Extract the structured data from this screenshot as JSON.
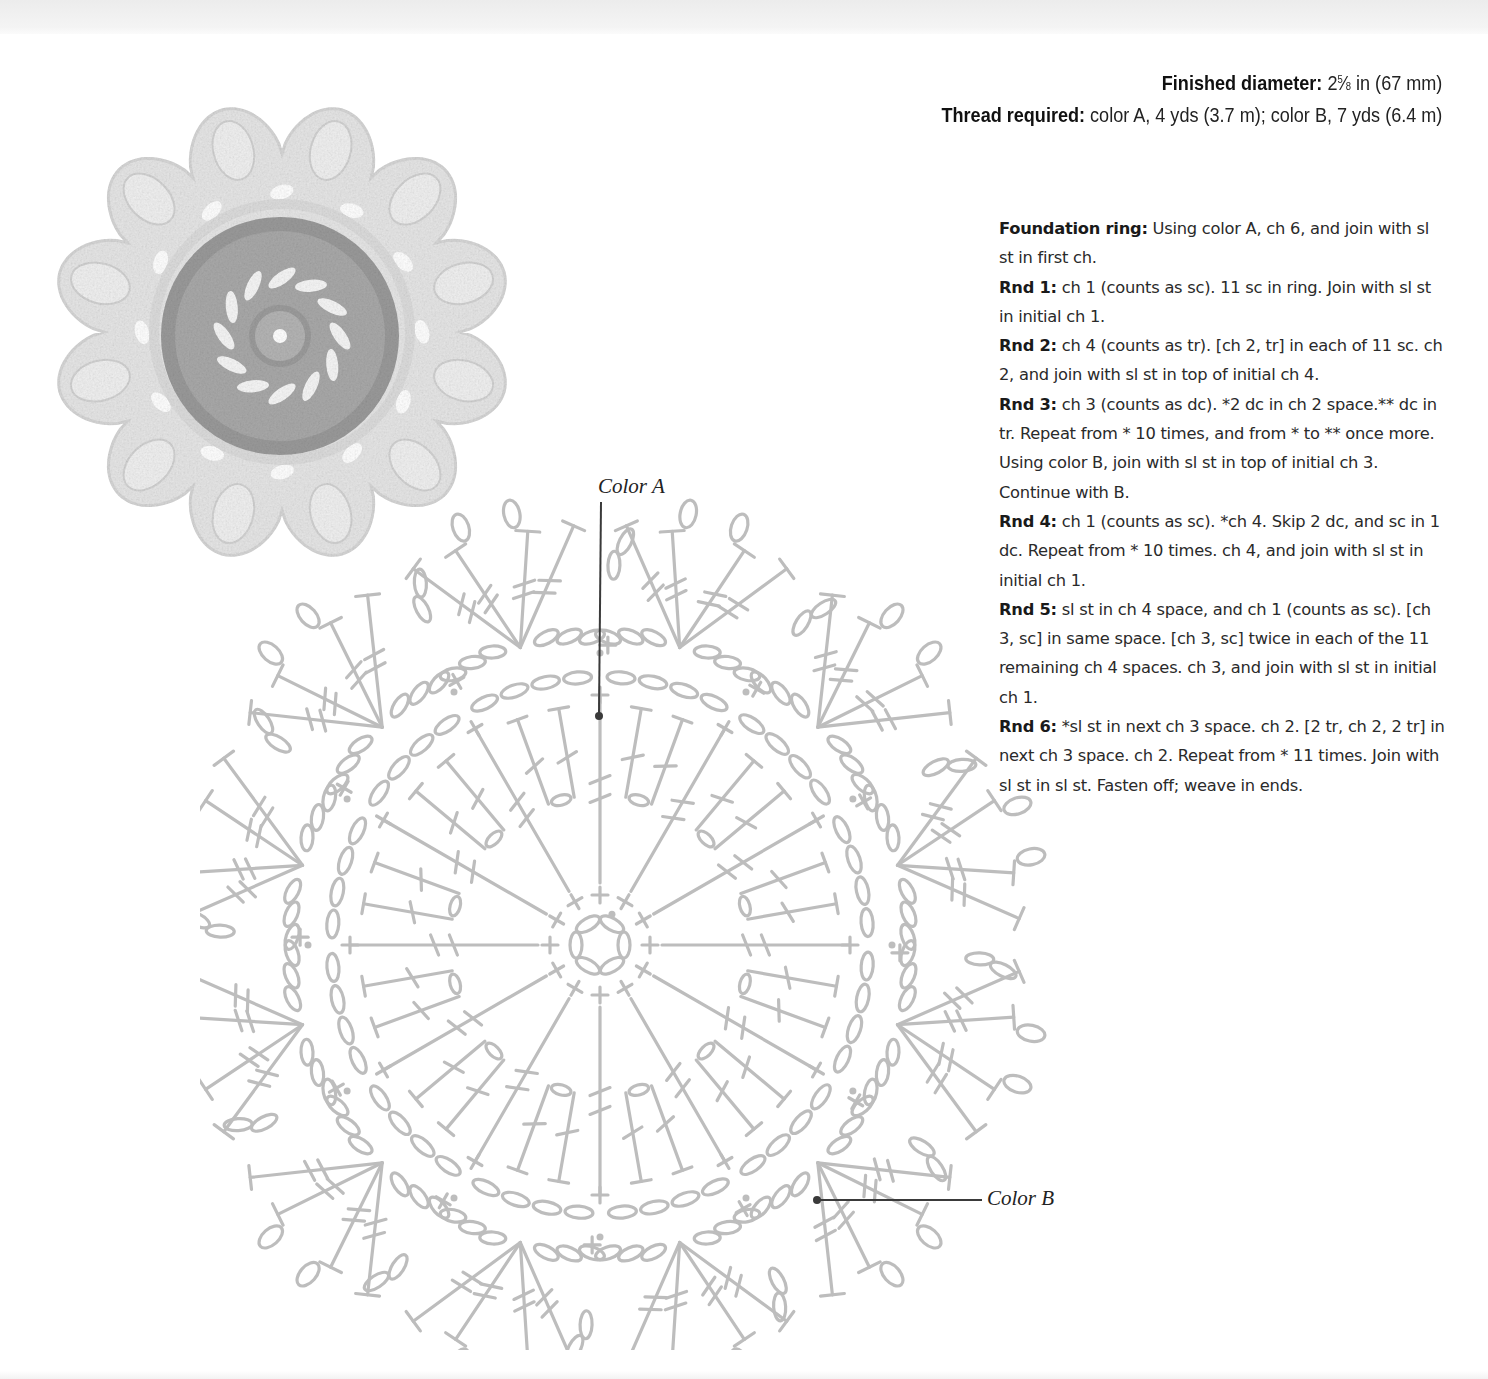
{
  "specs": {
    "diameter_label": "Finished diameter:",
    "diameter_whole": "2",
    "diameter_num": "5",
    "diameter_slash": "⁄",
    "diameter_den": "8",
    "diameter_rest": " in (67 mm)",
    "thread_label": "Thread required:",
    "thread_value": " color A, 4 yds (3.7 m); color B, 7 yds (6.4 m)"
  },
  "instructions": [
    {
      "label": "Foundation ring:",
      "text": " Using color A, ch 6, and join with sl st in first ch."
    },
    {
      "label": "Rnd 1:",
      "text": " ch 1 (counts as sc). 11 sc in ring. Join with sl st in initial ch 1."
    },
    {
      "label": "Rnd 2:",
      "text": " ch 4 (counts as tr). [ch 2, tr] in each of 11 sc. ch 2, and join with sl st in top of initial ch 4."
    },
    {
      "label": "Rnd 3:",
      "text": " ch 3 (counts as dc). *2 dc in ch 2 space.** dc in tr. Repeat from * 10 times, and from * to ** once more. Using color B, join with sl st in top of initial ch 3. Continue with B."
    },
    {
      "label": "Rnd 4:",
      "text": " ch 1 (counts as sc). *ch 4. Skip 2 dc, and sc in 1 dc. Repeat from * 10 times. ch 4, and join with sl st in initial ch 1."
    },
    {
      "label": "Rnd 5:",
      "text": " sl st in ch 4 space, and ch 1 (counts as sc). [ch 3, sc] in same space. [ch 3, sc] twice in each of the 11 remaining ch 4 spaces. ch 3, and join with sl st in initial ch 1."
    },
    {
      "label": "Rnd 6:",
      "text": " *sl st in next ch 3 space. ch 2. [2 tr, ch 2, 2 tr] in next ch 3 space. ch 2. Repeat from * 11 times. Join with sl st in sl st. Fasten off; weave in ends."
    }
  ],
  "chart": {
    "callout_a": "Color A",
    "callout_b": "Color B",
    "repeats": 12,
    "stitch_color": "#bdbdbd",
    "leader_color": "#3a3a3a"
  },
  "photo": {
    "alt": "Finished crocheted flower motif",
    "color_a": "#a9a9a9",
    "color_b": "#e6e6e6"
  },
  "colors": {
    "text": "#222222",
    "background": "#ffffff",
    "band": "#efefef"
  }
}
